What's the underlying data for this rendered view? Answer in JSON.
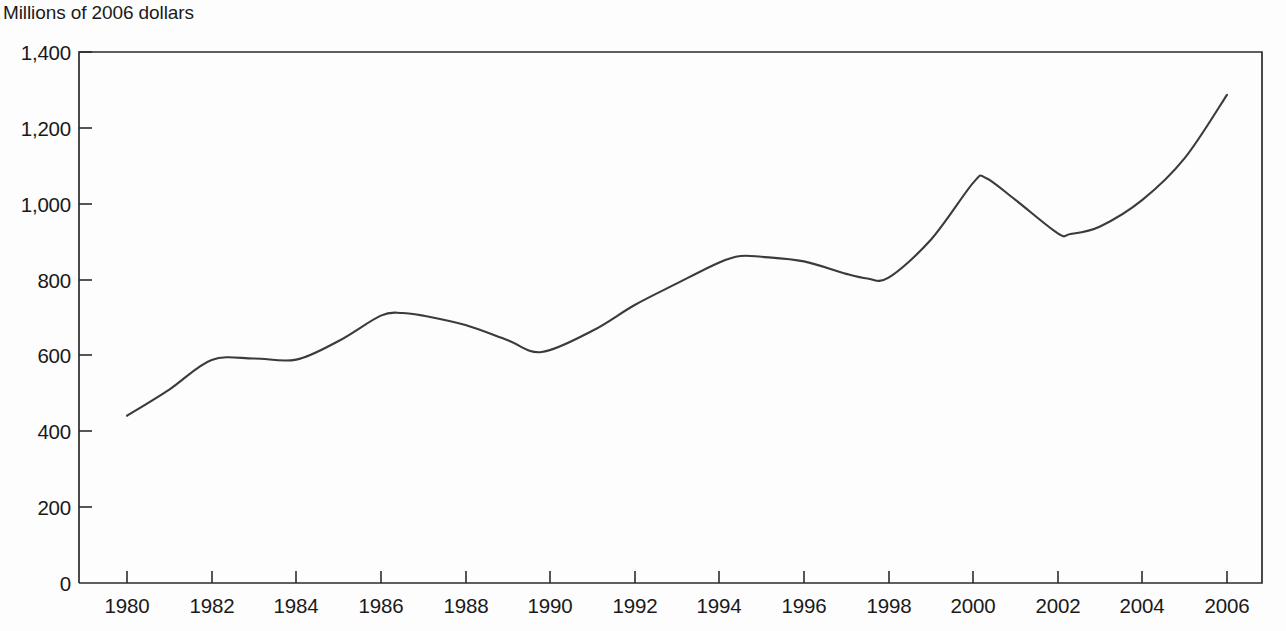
{
  "chart_data": {
    "type": "line",
    "title": "",
    "ylabel": "Millions of 2006 dollars",
    "xlabel": "",
    "grid": false,
    "legend": "none",
    "line_color": "#3a3a3f",
    "axis_color": "#2b2b2b",
    "background": "#fdfdfd",
    "xlim": [
      1979.8,
      2006.2
    ],
    "ylim": [
      0,
      1400
    ],
    "ytick_labels": [
      "0",
      "200",
      "400",
      "600",
      "800",
      "1,000",
      "1,200",
      "1,400"
    ],
    "ytick_values": [
      0,
      200,
      400,
      600,
      800,
      1000,
      1200,
      1400
    ],
    "xtick_labels": [
      "1980",
      "1982",
      "1984",
      "1986",
      "1988",
      "1990",
      "1992",
      "1994",
      "1996",
      "1998",
      "2000",
      "2002",
      "2004",
      "2006"
    ],
    "xtick_values": [
      1980,
      1982,
      1984,
      1986,
      1988,
      1990,
      1992,
      1994,
      1996,
      1998,
      2000,
      2002,
      2004,
      2006
    ],
    "x": [
      1980,
      1981,
      1982,
      1983,
      1984,
      1985,
      1986,
      1986.5,
      1987,
      1988,
      1989,
      1989.8,
      1991,
      1992,
      1993,
      1994,
      1994.5,
      1995,
      1996,
      1997,
      1997.5,
      1998,
      1999,
      2000,
      2000.3,
      2001,
      2002,
      2002.3,
      2003,
      2004,
      2005,
      2006
    ],
    "values": [
      441,
      510,
      588,
      592,
      589,
      638,
      705,
      712,
      705,
      680,
      640,
      609,
      665,
      733,
      790,
      845,
      862,
      860,
      848,
      815,
      803,
      805,
      905,
      1055,
      1068,
      1010,
      922,
      920,
      940,
      1010,
      1120,
      1287
    ],
    "series": [
      {
        "name": "Millions of 2006 dollars",
        "values": [
          441,
          510,
          588,
          592,
          589,
          638,
          705,
          712,
          705,
          680,
          640,
          609,
          665,
          733,
          790,
          845,
          862,
          860,
          848,
          815,
          803,
          805,
          905,
          1055,
          1068,
          1010,
          922,
          920,
          940,
          1010,
          1120,
          1287
        ]
      }
    ],
    "annotations": []
  },
  "figure": {
    "axis_title": "Millions of 2006 dollars"
  }
}
